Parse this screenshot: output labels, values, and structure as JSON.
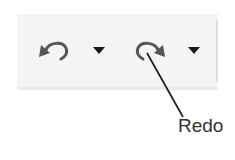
{
  "toolbar": {
    "background": "#f4f4f4",
    "icon_color": "#555555",
    "buttons": [
      {
        "name": "undo",
        "icon": "undo-arrow-icon",
        "tooltip": ""
      },
      {
        "name": "undo-dropdown",
        "icon": "caret-down-icon"
      },
      {
        "name": "redo",
        "icon": "redo-arrow-icon"
      },
      {
        "name": "redo-dropdown",
        "icon": "caret-down-icon"
      }
    ]
  },
  "callout": {
    "label": "Redo",
    "target": "redo-button",
    "line_color": "#1a1a1a"
  }
}
